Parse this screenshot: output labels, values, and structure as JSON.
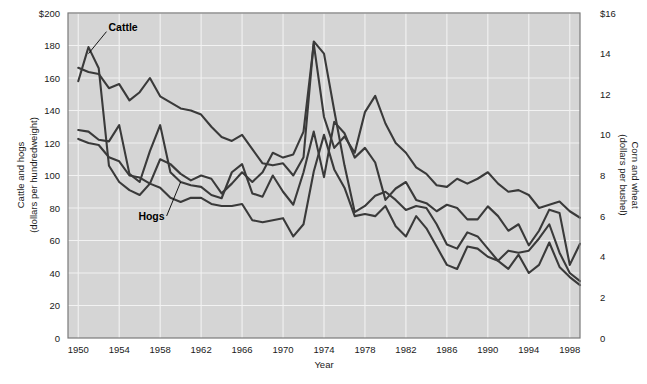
{
  "chart_data": {
    "type": "line",
    "title": "",
    "xlabel": "Year",
    "ylabel": "Cattle and hogs (dollars per hundredweight)",
    "y2label": "Corn and wheat (dollars per bushel)",
    "xlim": [
      1949,
      1999
    ],
    "ylim": [
      0,
      200
    ],
    "y2lim": [
      0,
      16
    ],
    "grid": true,
    "legend_position": "inline-annotations",
    "x_tick_labels": [
      "1950",
      "1954",
      "1958",
      "1962",
      "1966",
      "1970",
      "1974",
      "1978",
      "1982",
      "1986",
      "1990",
      "1994",
      "1998"
    ],
    "x_ticks": [
      1950,
      1954,
      1958,
      1962,
      1966,
      1970,
      1974,
      1978,
      1982,
      1986,
      1990,
      1994,
      1998
    ],
    "y_tick_labels": [
      "$200",
      "180",
      "160",
      "140",
      "120",
      "100",
      "80",
      "60",
      "40",
      "20",
      "0"
    ],
    "y_ticks": [
      200,
      180,
      160,
      140,
      120,
      100,
      80,
      60,
      40,
      20,
      0
    ],
    "y2_tick_labels": [
      "$16",
      "14",
      "12",
      "10",
      "8",
      "6",
      "4",
      "2",
      "0"
    ],
    "y2_ticks": [
      16,
      14,
      12,
      10,
      8,
      6,
      4,
      2,
      0
    ],
    "x": [
      1950,
      1951,
      1952,
      1953,
      1954,
      1955,
      1956,
      1957,
      1958,
      1959,
      1960,
      1961,
      1962,
      1963,
      1964,
      1965,
      1966,
      1967,
      1968,
      1969,
      1970,
      1971,
      1972,
      1973,
      1974,
      1975,
      1976,
      1977,
      1978,
      1979,
      1980,
      1981,
      1982,
      1983,
      1984,
      1985,
      1986,
      1987,
      1988,
      1989,
      1990,
      1991,
      1992,
      1993,
      1994,
      1995,
      1996,
      1997,
      1998,
      1999
    ],
    "series": [
      {
        "name": "Cattle",
        "axis": "left",
        "units": "dollars per hundredweight",
        "label_annotation": "Cattle",
        "values": [
          158,
          179,
          166,
          106,
          96,
          91,
          88,
          95,
          110,
          107,
          101,
          97,
          100,
          98,
          89,
          95,
          102,
          96,
          102,
          114,
          111,
          113,
          127,
          181,
          136,
          117,
          124,
          114,
          139,
          149,
          132,
          120,
          114,
          105,
          101,
          94,
          93,
          98,
          95,
          98,
          102,
          95,
          90,
          91,
          88,
          80,
          82,
          84,
          78,
          74
        ]
      },
      {
        "name": "Wheat",
        "axis": "right",
        "units": "dollars per bushel",
        "label_annotation": "Wheat",
        "values": [
          13.3,
          13.1,
          13.0,
          12.3,
          12.5,
          11.7,
          12.1,
          12.8,
          11.9,
          11.6,
          11.3,
          11.2,
          11.0,
          10.4,
          9.9,
          9.7,
          10.0,
          9.3,
          8.6,
          8.5,
          8.6,
          8.0,
          8.9,
          14.6,
          14.0,
          11.2,
          8.5,
          6.2,
          6.5,
          7.0,
          7.2,
          6.8,
          6.3,
          6.5,
          6.4,
          5.6,
          4.6,
          4.4,
          5.2,
          5.0,
          4.4,
          3.8,
          4.3,
          4.2,
          4.3,
          4.9,
          5.6,
          4.2,
          3.2,
          2.8
        ]
      },
      {
        "name": "Hogs",
        "axis": "left",
        "units": "dollars per hundredweight",
        "label_annotation": "Hogs",
        "values": [
          128,
          127,
          122,
          121,
          131,
          101,
          96,
          115,
          131,
          102,
          96,
          94,
          93,
          88,
          86,
          102,
          107,
          89,
          87,
          100,
          90,
          82,
          102,
          127,
          99,
          133,
          126,
          111,
          117,
          108,
          85,
          92,
          96,
          85,
          83,
          78,
          82,
          80,
          73,
          73,
          81,
          75,
          66,
          70,
          57,
          66,
          79,
          77,
          45,
          58
        ]
      },
      {
        "name": "Corn",
        "axis": "right",
        "units": "dollars per bushel",
        "label_annotation": "Corn",
        "values": [
          9.8,
          9.6,
          9.5,
          8.9,
          8.7,
          8.0,
          7.9,
          7.6,
          7.4,
          6.9,
          6.7,
          6.9,
          6.9,
          6.6,
          6.5,
          6.5,
          6.6,
          5.8,
          5.7,
          5.8,
          5.9,
          5.0,
          5.6,
          8.2,
          10.0,
          8.3,
          7.4,
          6.0,
          6.1,
          6.0,
          6.5,
          5.5,
          5.0,
          6.0,
          5.4,
          4.5,
          3.6,
          3.4,
          4.5,
          4.4,
          4.0,
          3.8,
          3.4,
          4.1,
          3.2,
          3.6,
          4.7,
          3.5,
          3.0,
          2.6
        ]
      }
    ],
    "annotations": [
      {
        "text": "Cattle",
        "points_to_year": 1951,
        "points_to_value": 175
      },
      {
        "text": "Wheat",
        "points_to_year": 1957,
        "points_to_value": 157
      },
      {
        "text": "Hogs",
        "points_to_year": 1960,
        "points_to_value": 96
      },
      {
        "text": "Corn",
        "points_to_year": 1962,
        "points_to_value": 76
      }
    ]
  },
  "axes": {
    "left_title_line1": "Cattle and hogs",
    "left_title_line2": "(dollars per hundredweight)",
    "right_title_line1": "Corn and wheat",
    "right_title_line2": "(dollars per bushel)",
    "x_title": "Year"
  }
}
